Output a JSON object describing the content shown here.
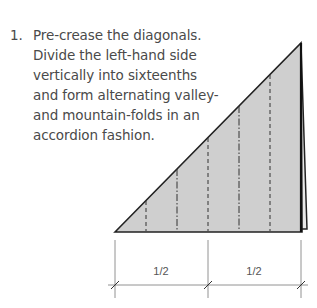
{
  "step": {
    "number": "1.",
    "lines": [
      "Pre-crease the diagonals.",
      "Divide the left-hand side",
      "vertically into sixteenths",
      "and form alternating valley-",
      "and mountain-folds in an",
      "accordion fashion."
    ]
  },
  "diagram": {
    "paper_fill": "#cfcfcf",
    "line_color": "#222222",
    "crease_lines": [
      {
        "x": 146,
        "type": "valley"
      },
      {
        "x": 177,
        "type": "mountain"
      },
      {
        "x": 208,
        "type": "valley"
      },
      {
        "x": 239,
        "type": "mountain"
      },
      {
        "x": 270,
        "type": "valley"
      }
    ],
    "dimensions": [
      {
        "label": "1/2"
      },
      {
        "label": "1/2"
      }
    ]
  }
}
